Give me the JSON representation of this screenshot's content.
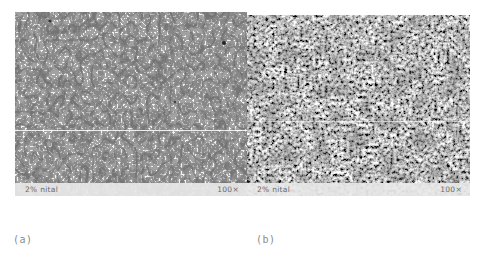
{
  "figure": {
    "panels": [
      {
        "id": "a",
        "caption": "(a)",
        "etchant_label": "2% nital",
        "magnification_label": "100×",
        "description": "light ferrite grain structure with fine dark grain boundaries"
      },
      {
        "id": "b",
        "caption": "(b)",
        "etchant_label": "2% nital",
        "magnification_label": "100×",
        "description": "dense dark mottled fine-grained structure"
      }
    ]
  }
}
